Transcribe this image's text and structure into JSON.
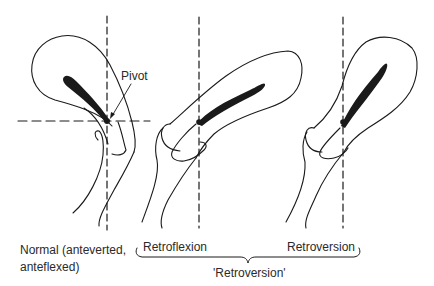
{
  "annotations": {
    "pivot": "Pivot"
  },
  "figures": [
    {
      "id": "normal",
      "label_line1": "Normal (anteverted,",
      "label_line2": "anteflexed)"
    },
    {
      "id": "retroflexion",
      "label": "Retroflexion"
    },
    {
      "id": "retroversion",
      "label": "Retroversion"
    }
  ],
  "group_label": "'Retroversion'",
  "colors": {
    "line": "#1a1a1a",
    "background": "#ffffff"
  }
}
